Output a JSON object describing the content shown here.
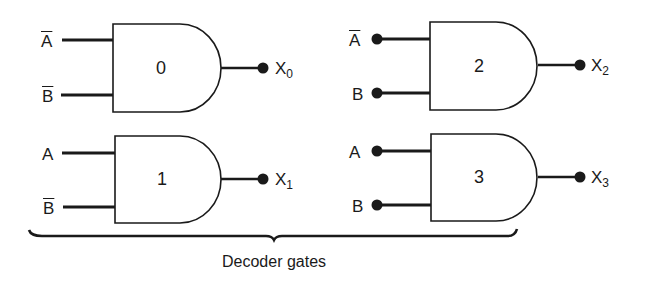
{
  "diagram": {
    "caption": "Decoder gates",
    "line_color": "#1a1a1a",
    "gates": [
      {
        "id": "0",
        "type": "AND",
        "inputs": [
          {
            "label": "A",
            "inverted": true,
            "dot": false
          },
          {
            "label": "B",
            "inverted": true,
            "dot": false
          }
        ],
        "output": {
          "name": "X",
          "subscript": "0"
        }
      },
      {
        "id": "1",
        "type": "AND",
        "inputs": [
          {
            "label": "A",
            "inverted": false,
            "dot": false
          },
          {
            "label": "B",
            "inverted": true,
            "dot": false
          }
        ],
        "output": {
          "name": "X",
          "subscript": "1"
        }
      },
      {
        "id": "2",
        "type": "AND",
        "inputs": [
          {
            "label": "A",
            "inverted": true,
            "dot": true
          },
          {
            "label": "B",
            "inverted": false,
            "dot": true
          }
        ],
        "output": {
          "name": "X",
          "subscript": "2"
        }
      },
      {
        "id": "3",
        "type": "AND",
        "inputs": [
          {
            "label": "A",
            "inverted": false,
            "dot": true
          },
          {
            "label": "B",
            "inverted": false,
            "dot": true
          }
        ],
        "output": {
          "name": "X",
          "subscript": "3"
        }
      }
    ]
  }
}
